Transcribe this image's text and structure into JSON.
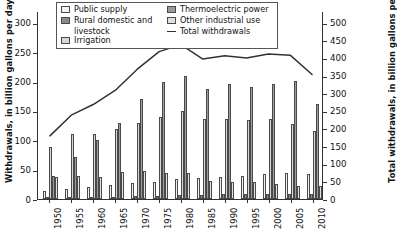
{
  "chart_data": {
    "type": "bar",
    "title": "",
    "subtitle": "",
    "xlabel": "",
    "ylabel": "Withdrawals, in billion gallons per day",
    "ylabel_right": "Total withdrawals, in billion gallons per day",
    "grid": false,
    "legend_position": "top-inside",
    "categories": [
      "1950",
      "1955",
      "1960",
      "1965",
      "1970",
      "1975",
      "1980",
      "1985",
      "1990",
      "1995",
      "2000",
      "2005",
      "2010"
    ],
    "ylim": [
      0,
      320
    ],
    "yticks": [
      0,
      50,
      100,
      150,
      200,
      250,
      300
    ],
    "ylim_right": [
      0,
      533
    ],
    "yticks_right": [
      0,
      50,
      100,
      150,
      200,
      250,
      300,
      350,
      400,
      450,
      500
    ],
    "series": [
      {
        "name": "Public supply",
        "color": "#f2f2f2",
        "values": [
          14,
          17,
          21,
          24,
          27,
          29,
          34,
          36,
          38,
          40,
          43,
          44,
          42
        ]
      },
      {
        "name": "Rural domestic and livestock",
        "color": "#8a8a8a",
        "values": [
          4,
          4,
          4,
          4,
          5,
          5,
          6,
          7,
          8,
          9,
          9,
          9,
          9
        ]
      },
      {
        "name": "Irrigation",
        "color": "#d6d6d6",
        "values": [
          89,
          110,
          110,
          120,
          130,
          140,
          150,
          137,
          137,
          134,
          137,
          128,
          115
        ]
      },
      {
        "name": "Thermoelectric power",
        "color": "#9b9b9b",
        "values": [
          40,
          72,
          100,
          130,
          170,
          200,
          210,
          187,
          195,
          190,
          195,
          201,
          161
        ]
      },
      {
        "name": "Other industrial use",
        "color": "#e0e0e0",
        "values": [
          37,
          39,
          38,
          46,
          47,
          45,
          45,
          30,
          29,
          29,
          25,
          23,
          23
        ]
      }
    ],
    "line_series": {
      "name": "Total withdrawals",
      "color": "#333333",
      "axis": "right",
      "values": [
        180,
        240,
        270,
        310,
        370,
        420,
        440,
        399,
        408,
        402,
        413,
        410,
        355
      ]
    }
  },
  "legend": {
    "col_a": [
      {
        "label": "Public supply",
        "swatch": "#f2f2f2",
        "type": "box"
      },
      {
        "label": "Rural domestic and",
        "label2": "livestock",
        "swatch": "#8a8a8a",
        "type": "box"
      },
      {
        "label": "Irrigation",
        "swatch": "#d6d6d6",
        "type": "box"
      }
    ],
    "col_b": [
      {
        "label": "Thermoelectric power",
        "swatch": "#9b9b9b",
        "type": "box"
      },
      {
        "label": "Other industrial use",
        "swatch": "#e0e0e0",
        "type": "box"
      },
      {
        "label": "Total withdrawals",
        "swatch": "#333333",
        "type": "line"
      }
    ]
  }
}
